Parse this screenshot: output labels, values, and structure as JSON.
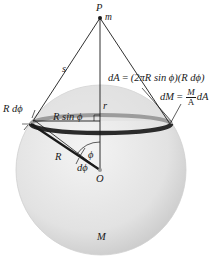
{
  "figure": {
    "labels": {
      "point_P": "P",
      "mass_m": "m",
      "distance_s": "s",
      "distance_r": "r",
      "radius_R": "R",
      "ring_radius": "R sin ϕ",
      "arc_width": "R dϕ",
      "angle_phi": "ϕ",
      "angle_dphi": "dϕ",
      "center_O": "O",
      "sphere_mass_M": "M"
    },
    "equations": {
      "dA_lhs": "dA",
      "dA_eq": " = ",
      "dA_rhs": "(2πR sin ϕ)(R dϕ)",
      "dM_lhs": "dM",
      "dM_eq": " = ",
      "dM_num": "M",
      "dM_den": "A",
      "dM_tail": "dA"
    },
    "colors": {
      "sphere_light": "#eeeeee",
      "sphere_dark": "#c9c9c9",
      "cap_tint": "#d8d8d8",
      "ring_dark": "#2b2b2b",
      "ring_far": "#9a9a9a",
      "line": "#1a1a1a"
    }
  }
}
